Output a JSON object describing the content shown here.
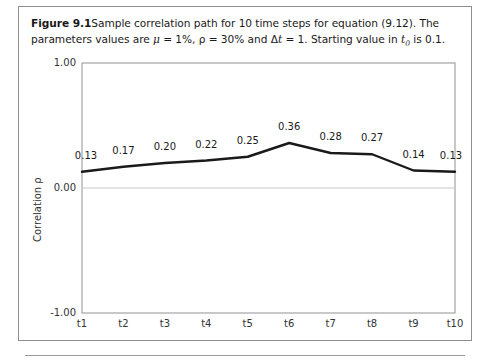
{
  "figure": {
    "label": "Figure 9.1",
    "caption_part1": "Sample correlation path for 10 time steps for equation (9.12). The parameters values are ",
    "mu_symbol": "μ",
    "caption_part2": " = 1%, ",
    "rho_symbol": "ρ",
    "caption_part3": " = 30% and ",
    "delta_symbol": "Δ",
    "t_symbol": "t",
    "caption_part4": " = 1. Starting value in ",
    "t0_symbol": "t",
    "t0_sub": "0",
    "caption_part5": " is 0.1."
  },
  "chart_data": {
    "type": "line",
    "title": "",
    "xlabel": "",
    "ylabel": "Correlation ρ",
    "categories": [
      "t1",
      "t2",
      "t3",
      "t4",
      "t5",
      "t6",
      "t7",
      "t8",
      "t9",
      "t10"
    ],
    "values": [
      0.13,
      0.17,
      0.2,
      0.22,
      0.25,
      0.36,
      0.28,
      0.27,
      0.14,
      0.13
    ],
    "data_labels": [
      "0.13",
      "0.17",
      "0.20",
      "0.22",
      "0.25",
      "0.36",
      "0.28",
      "0.27",
      "0.14",
      "0.13"
    ],
    "ylim": [
      -1.0,
      1.0
    ],
    "ytick_labels": [
      "1.00",
      "0.00",
      "-1.00"
    ],
    "ytick_values": [
      1.0,
      0.0,
      -1.0
    ],
    "grid": "horizontal-zero-line",
    "legend": "none",
    "series_color": "#1a1a1a"
  },
  "colors": {
    "line": "#1a1a1a",
    "frame": "#9b9b9b",
    "gridline": "#c9c9c9",
    "box_border": "#8e8e8e",
    "text": "#1a1a1a"
  }
}
